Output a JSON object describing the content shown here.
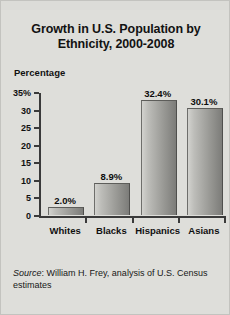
{
  "chart_data": {
    "type": "bar",
    "title": "Growth in U.S. Population by Ethnicity, 2000-2008",
    "title_line1": "Growth in U.S. Population by",
    "title_line2": "Ethnicity, 2000-2008",
    "ylabel": "Percentage",
    "xlabel": "",
    "categories": [
      "Whites",
      "Blacks",
      "Hispanics",
      "Asians"
    ],
    "values": [
      2.0,
      8.9,
      32.4,
      30.1
    ],
    "value_labels": [
      "2.0%",
      "8.9%",
      "32.4%",
      "30.1%"
    ],
    "ylim": [
      0,
      35
    ],
    "yticks": [
      0,
      5,
      10,
      15,
      20,
      25,
      30,
      35
    ],
    "ytick_labels": [
      "0",
      "5",
      "10",
      "15",
      "20",
      "25",
      "30",
      "35%"
    ],
    "grid": false,
    "legend": null,
    "bar_gradient_from": "#d2d2ce",
    "bar_gradient_to": "#7c7c79",
    "axis_color": "#3a3a3a",
    "background": "#dededa"
  },
  "footnote": {
    "source_word": "Source",
    "source_text": ": William H. Frey, analysis of U.S. Census estimates"
  }
}
